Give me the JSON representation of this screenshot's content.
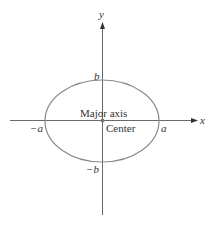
{
  "diagram": {
    "type": "ellipse-on-axes",
    "colors": {
      "axis": "#6a6a6a",
      "ellipse": "#8a8a8a",
      "text": "#333333",
      "center_dot": "#777777"
    },
    "axes": {
      "x_label": "x",
      "y_label": "y"
    },
    "intercepts": {
      "pos_a": "a",
      "neg_a": "−a",
      "pos_b": "b",
      "neg_b": "−b"
    },
    "annotations": {
      "major_axis": "Major axis",
      "center": "Center"
    }
  }
}
